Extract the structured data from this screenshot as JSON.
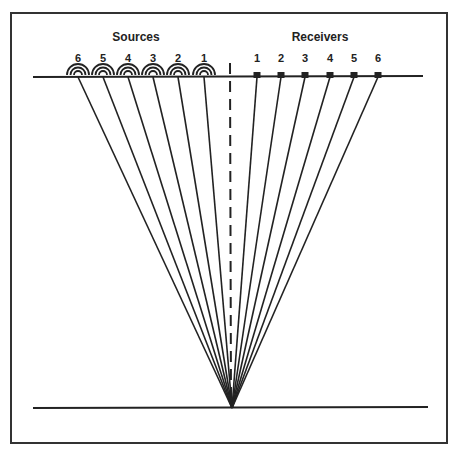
{
  "title_sources": "Sources",
  "title_receivers": "Receivers",
  "sources": [
    {
      "label": "6",
      "x": 78
    },
    {
      "label": "5",
      "x": 103
    },
    {
      "label": "4",
      "x": 128
    },
    {
      "label": "3",
      "x": 153
    },
    {
      "label": "2",
      "x": 178
    },
    {
      "label": "1",
      "x": 204
    }
  ],
  "receivers": [
    {
      "label": "1",
      "x": 257
    },
    {
      "label": "2",
      "x": 281
    },
    {
      "label": "3",
      "x": 305
    },
    {
      "label": "4",
      "x": 330
    },
    {
      "label": "5",
      "x": 354
    },
    {
      "label": "6",
      "x": 378
    }
  ],
  "reflection_point": {
    "x": 232,
    "y": 408
  },
  "colors": {
    "line": "#222222",
    "frame": "#333333"
  }
}
